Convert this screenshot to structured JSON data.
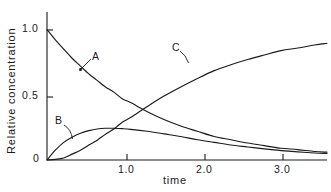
{
  "chart_data": {
    "type": "line",
    "title": "",
    "subtitle": "",
    "xlabel": "time",
    "ylabel": "Relative concentration",
    "xlim": [
      0,
      3.35
    ],
    "ylim": [
      0,
      1.05
    ],
    "xticks": [
      1.0,
      2.0,
      3.0
    ],
    "xtick_labels": [
      "1.0",
      "2.0",
      "3.0"
    ],
    "yticks": [
      0,
      0.5,
      1.0
    ],
    "ytick_labels": [
      "0",
      "0.5",
      "1.0"
    ],
    "grid": false,
    "legend": "inline-curve-labels",
    "line_color": "#1a1a1a",
    "background_color": "#ffffff",
    "annotations": [
      {
        "text": "A",
        "curve": "A",
        "label_x": 0.6,
        "label_y": 0.76,
        "point_x": 0.42,
        "point_y": 0.67
      },
      {
        "text": "B",
        "curve": "B",
        "label_x": 0.14,
        "label_y": 0.3,
        "point_x": 0.32,
        "point_y": 0.175
      },
      {
        "text": "C",
        "curve": "C",
        "label_x": 1.68,
        "label_y": 0.82,
        "point_x": 1.81,
        "point_y": 0.735
      }
    ],
    "series": [
      {
        "name": "A",
        "description": "reactant A, first-order decay",
        "x": [
          0.0,
          0.1,
          0.2,
          0.3,
          0.4,
          0.5,
          0.6,
          0.7,
          0.8,
          0.9,
          1.0,
          1.2,
          1.4,
          1.6,
          1.8,
          2.0,
          2.2,
          2.4,
          2.6,
          2.8,
          3.0,
          3.2,
          3.35
        ],
        "values": [
          1.0,
          0.92,
          0.85,
          0.78,
          0.72,
          0.66,
          0.61,
          0.56,
          0.52,
          0.47,
          0.44,
          0.37,
          0.31,
          0.26,
          0.22,
          0.18,
          0.155,
          0.13,
          0.11,
          0.09,
          0.08,
          0.065,
          0.06
        ]
      },
      {
        "name": "B",
        "description": "intermediate B, rises to maximum then decays",
        "x": [
          0.0,
          0.1,
          0.2,
          0.3,
          0.4,
          0.5,
          0.6,
          0.7,
          0.8,
          0.9,
          1.0,
          1.2,
          1.4,
          1.6,
          1.8,
          2.0,
          2.2,
          2.4,
          2.6,
          2.8,
          3.0,
          3.2,
          3.35
        ],
        "values": [
          0.0,
          0.075,
          0.135,
          0.175,
          0.205,
          0.225,
          0.238,
          0.243,
          0.243,
          0.24,
          0.235,
          0.22,
          0.2,
          0.18,
          0.155,
          0.135,
          0.115,
          0.1,
          0.085,
          0.072,
          0.062,
          0.054,
          0.05
        ]
      },
      {
        "name": "C",
        "description": "product C, sigmoidal rise toward 1.0",
        "x": [
          0.0,
          0.1,
          0.2,
          0.3,
          0.4,
          0.5,
          0.6,
          0.7,
          0.8,
          0.9,
          1.0,
          1.2,
          1.4,
          1.6,
          1.8,
          2.0,
          2.2,
          2.4,
          2.6,
          2.8,
          3.0,
          3.2,
          3.35
        ],
        "values": [
          0.0,
          0.005,
          0.015,
          0.045,
          0.075,
          0.115,
          0.152,
          0.197,
          0.237,
          0.29,
          0.325,
          0.41,
          0.49,
          0.56,
          0.625,
          0.685,
          0.73,
          0.77,
          0.805,
          0.838,
          0.858,
          0.881,
          0.895
        ]
      }
    ]
  },
  "axes": {
    "ylabel": "Relative concentration",
    "xlabel": "time",
    "ytick_1_0": "1.0",
    "ytick_0_5": "0.5",
    "ytick_0": "0",
    "xtick_1_0": "1.0",
    "xtick_2_0": "2.0",
    "xtick_3_0": "3.0"
  },
  "curve_labels": {
    "a": "A",
    "b": "B",
    "c": "C"
  }
}
